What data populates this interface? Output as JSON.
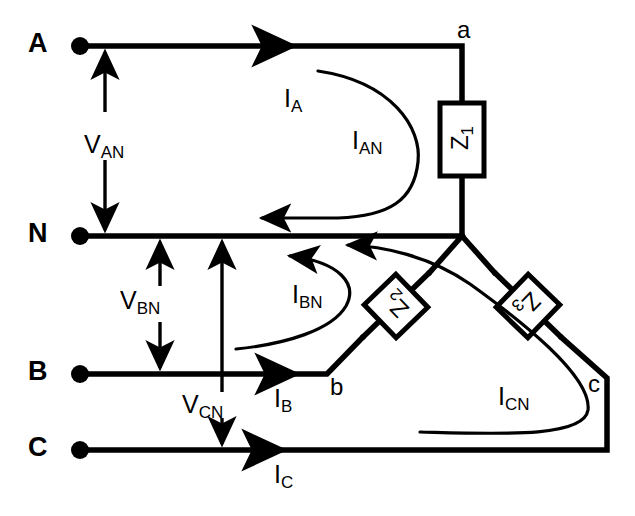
{
  "diagram": {
    "stroke_color": "#000000",
    "background_color": "#ffffff",
    "supply_terminals": [
      {
        "id": "A",
        "label": "A",
        "x": 38,
        "y": 46,
        "dot_x": 80,
        "dot_y": 46
      },
      {
        "id": "N",
        "label": "N",
        "x": 38,
        "y": 236,
        "dot_x": 80,
        "dot_y": 236
      },
      {
        "id": "B",
        "label": "B",
        "x": 38,
        "y": 374,
        "dot_x": 80,
        "dot_y": 374
      },
      {
        "id": "C",
        "label": "C",
        "x": 38,
        "y": 450,
        "dot_x": 80,
        "dot_y": 450
      }
    ],
    "load_nodes": [
      {
        "id": "a",
        "label": "a",
        "x": 462,
        "y": 46
      },
      {
        "id": "b",
        "label": "b",
        "x": 327,
        "y": 374
      },
      {
        "id": "c",
        "label": "c",
        "x": 607,
        "y": 378
      }
    ],
    "impedances": [
      {
        "id": "Z1",
        "label": "Z",
        "sub": "1",
        "orientation": "vertical",
        "cx": 462,
        "cy": 140
      },
      {
        "id": "Z2",
        "label": "Z",
        "sub": "2",
        "orientation": "diagonal-up-right",
        "cx": 396,
        "cy": 306
      },
      {
        "id": "Z3",
        "label": "Z",
        "sub": "3",
        "orientation": "diagonal-down-right",
        "cx": 528,
        "cy": 306
      }
    ],
    "voltages": [
      {
        "id": "VAN",
        "label": "V",
        "sub": "AN",
        "text_x": 84,
        "text_y": 132,
        "arrow_x": 105,
        "from_y": 46,
        "to_y": 236
      },
      {
        "id": "VBN",
        "label": "V",
        "sub": "BN",
        "text_x": 120,
        "text_y": 302,
        "arrow_x": 160,
        "from_y": 236,
        "to_y": 374
      },
      {
        "id": "VCN",
        "label": "V",
        "sub": "CN",
        "text_x": 182,
        "text_y": 408,
        "arrow_x": 222,
        "from_y": 236,
        "to_y": 450
      }
    ],
    "line_currents": [
      {
        "id": "IA",
        "label": "I",
        "sub": "A",
        "text_x": 284,
        "text_y": 104,
        "arrow_x": 292,
        "arrow_y": 46
      },
      {
        "id": "IB",
        "label": "I",
        "sub": "B",
        "text_x": 272,
        "text_y": 390,
        "arrow_x": 295,
        "arrow_y": 374
      },
      {
        "id": "IC",
        "label": "I",
        "sub": "C",
        "text_x": 272,
        "text_y": 466,
        "arrow_x": 282,
        "arrow_y": 450
      }
    ],
    "phase_currents": [
      {
        "id": "IAN",
        "label": "I",
        "sub": "AN",
        "text_x": 352,
        "text_y": 132
      },
      {
        "id": "IBN",
        "label": "I",
        "sub": "BN",
        "text_x": 292,
        "text_y": 286
      },
      {
        "id": "ICN",
        "label": "I",
        "sub": "CN",
        "text_x": 498,
        "text_y": 388
      }
    ]
  }
}
